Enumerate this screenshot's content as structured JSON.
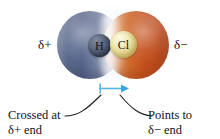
{
  "figure": {
    "molecule": {
      "atoms": [
        {
          "symbol": "H",
          "name": "hydrogen-atom",
          "color": "#4a5469"
        },
        {
          "symbol": "Cl",
          "name": "chlorine-atom",
          "color": "#eee5ab"
        }
      ],
      "surface_colors": {
        "positive_end": "#5d6c8e",
        "neutral_band": "#f7f7f8",
        "negative_end": "#c4511f"
      }
    },
    "charge_labels": {
      "positive": "δ+",
      "negative": "δ−"
    },
    "dipole": {
      "color": "#5ab4e6",
      "cross_symbol": "+",
      "direction": "right"
    },
    "annotations": {
      "left": {
        "line1": "Crossed at",
        "line2": "δ+ end"
      },
      "right": {
        "line1": "Points to",
        "line2": "δ− end"
      }
    }
  }
}
